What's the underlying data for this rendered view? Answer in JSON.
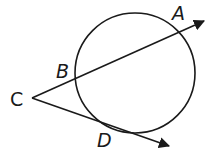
{
  "diagram": {
    "type": "circle-secant-tangent",
    "circle": {
      "cx": 135,
      "cy": 73,
      "r": 60
    },
    "points": {
      "A": {
        "label": "A",
        "x": 177,
        "y": 28
      },
      "B": {
        "label": "B",
        "x": 75,
        "y": 78
      },
      "C": {
        "label": "C",
        "x": 32,
        "y": 98
      },
      "D": {
        "label": "D",
        "x": 120,
        "y": 131
      }
    },
    "rays": [
      {
        "name": "secant-CA",
        "from": "C",
        "through": [
          "B",
          "A"
        ],
        "end": {
          "x": 205,
          "y": 20
        }
      },
      {
        "name": "tangent-CD",
        "from": "C",
        "through": [
          "D"
        ],
        "end": {
          "x": 170,
          "y": 147
        }
      }
    ],
    "labels": {
      "A": "A",
      "B": "B",
      "C": "C",
      "D": "D"
    },
    "stroke_color": "#1a1a1a"
  }
}
